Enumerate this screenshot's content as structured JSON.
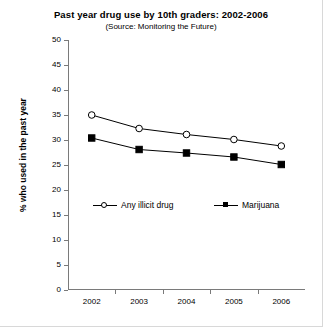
{
  "chart_data": {
    "type": "line",
    "title": "Past year drug use by 10th graders: 2002-2006",
    "subtitle": "(Source: Monitoring the Future)",
    "xlabel": "",
    "ylabel": "% who used in the past year",
    "categories": [
      "2002",
      "2003",
      "2004",
      "2005",
      "2006"
    ],
    "ylim": [
      0,
      50
    ],
    "yticks": [
      "0",
      "5",
      "10",
      "15",
      "20",
      "25",
      "30",
      "35",
      "40",
      "45",
      "50"
    ],
    "grid": false,
    "legend_position": "inside-lower-left",
    "series": [
      {
        "name": "Any illicit drug",
        "marker": "open-circle",
        "color": "#000000",
        "values": [
          35.0,
          32.3,
          31.1,
          30.1,
          28.8
        ]
      },
      {
        "name": "Marijuana",
        "marker": "filled-square",
        "color": "#000000",
        "values": [
          30.4,
          28.1,
          27.4,
          26.6,
          25.1
        ]
      }
    ]
  }
}
